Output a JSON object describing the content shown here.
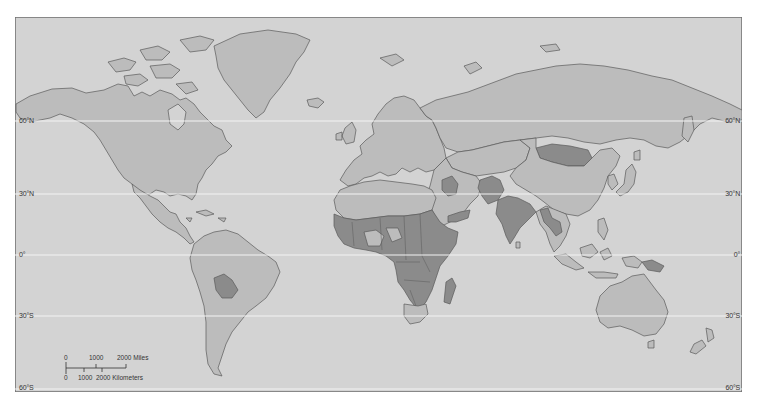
{
  "map": {
    "type": "world political map (grayscale, Miller-type projection)",
    "colors": {
      "ocean": "#d3d3d3",
      "land_light": "#bcbcbc",
      "land_dark": "#8b8b8b",
      "border": "#5a5a5a",
      "frame": "#6f6f6f",
      "graticule": "#f4f4f4"
    },
    "latitude_labels": {
      "n60_left": "60°N",
      "n60_right": "60°N",
      "n30_left": "30°N",
      "n30_right": "30°N",
      "eq_left": "0°",
      "eq_right": "0°",
      "s30_left": "30°S",
      "s30_right": "30°S",
      "s60_left": "60°S",
      "s60_right": "60°S"
    },
    "scale_bar": {
      "miles": {
        "zero": "0",
        "mid": "1000",
        "end": "2000 Miles"
      },
      "kilometers": {
        "zero": "0",
        "mid": "1000",
        "end": "2000 Kilometers"
      }
    },
    "highlighted_regions": [
      "Sub-Saharan Africa (most countries)",
      "Madagascar",
      "Bolivia",
      "India",
      "Afghanistan",
      "Pakistan",
      "Mongolia",
      "Iraq",
      "Yemen",
      "Laos",
      "Myanmar",
      "Papua New Guinea"
    ]
  }
}
